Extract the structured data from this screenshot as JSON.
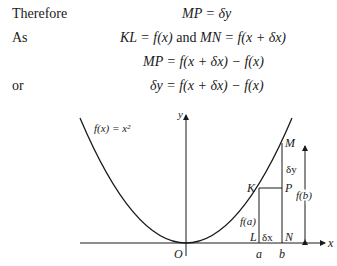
{
  "equations": [
    {
      "label": "Therefore",
      "expr": "MP = δy"
    },
    {
      "label": "As",
      "expr_left": "KL = f(x)",
      "conj": "and",
      "expr_right": "MN = f(x + δx)"
    },
    {
      "label": "",
      "expr": "MP = f(x + δx) − f(x)"
    },
    {
      "label": "or",
      "expr": "δy = f(x + δx) − f(x)"
    }
  ],
  "figure": {
    "curve_label": "f(x) = x²",
    "axis_x": "x",
    "axis_y": "y",
    "origin": "O",
    "points": {
      "K": "K",
      "L": "L",
      "M": "M",
      "N": "N",
      "P": "P"
    },
    "ticks": {
      "a": "a",
      "b": "b"
    },
    "annotations": {
      "delta_y": "δy",
      "delta_x": "δx",
      "fa": "f(a)",
      "fb": "f(b)"
    }
  }
}
